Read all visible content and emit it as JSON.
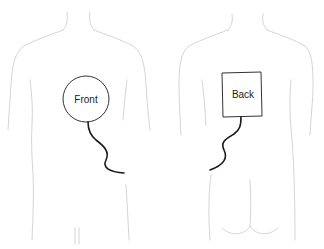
{
  "figure": {
    "views": [
      {
        "id": "front",
        "label": "Front",
        "pad_shape": "circle"
      },
      {
        "id": "back",
        "label": "Back",
        "pad_shape": "rectangle"
      }
    ],
    "colors": {
      "body_outline": "#c9c9c9",
      "pad_stroke": "#333333",
      "wire": "#1a1a1a",
      "background": "#ffffff"
    }
  }
}
